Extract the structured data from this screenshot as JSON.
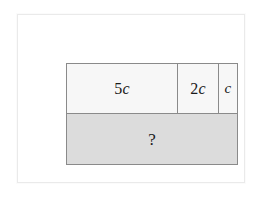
{
  "figure": {
    "type": "tape-diagram",
    "title": "",
    "background_color": "#ffffff",
    "frame_color": "#eaeaea",
    "border_color": "#8a8a8a"
  },
  "diagram": {
    "top_row": {
      "fill_color": "#f7f7f7",
      "cells": [
        {
          "label": "5c",
          "coefficient": "5",
          "variable": "c",
          "relative_width": 5
        },
        {
          "label": "2c",
          "coefficient": "2",
          "variable": "c",
          "relative_width": 2
        },
        {
          "label": "c",
          "coefficient": "",
          "variable": "c",
          "relative_width": 1
        }
      ]
    },
    "bottom_row": {
      "fill_color": "#dcdcdc",
      "label": "?"
    }
  },
  "chart_data": {
    "type": "bar",
    "categories": [
      "5c",
      "2c",
      "c"
    ],
    "values": [
      5,
      2,
      1
    ],
    "title": "",
    "xlabel": "",
    "ylabel": "",
    "annotations": [
      "?"
    ]
  }
}
